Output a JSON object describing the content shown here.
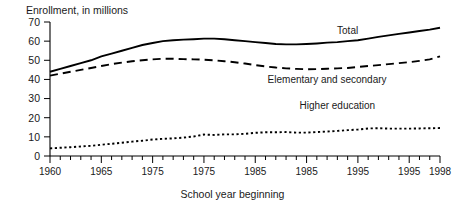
{
  "chart_data": {
    "type": "line",
    "title": "Enrollment, in millions",
    "xlabel": "School year beginning",
    "ylabel": "",
    "xlim": [
      1960,
      1998
    ],
    "ylim": [
      0,
      70
    ],
    "grid": false,
    "legend_position": "inline-annotations",
    "y_ticks": [
      70,
      60,
      50,
      40,
      30,
      20,
      10,
      0
    ],
    "x_ticks": [
      1960,
      1965,
      1975,
      1975,
      1985,
      1985,
      1995,
      1995,
      1998
    ],
    "x_tick_positions": [
      1960,
      1965,
      1970,
      1975,
      1980,
      1985,
      1990,
      1995,
      1998
    ],
    "x_minor_step": 1,
    "x": [
      1960,
      1961,
      1962,
      1963,
      1964,
      1965,
      1966,
      1967,
      1968,
      1969,
      1970,
      1971,
      1972,
      1973,
      1974,
      1975,
      1976,
      1977,
      1978,
      1979,
      1980,
      1981,
      1982,
      1983,
      1984,
      1985,
      1986,
      1987,
      1988,
      1989,
      1990,
      1991,
      1992,
      1993,
      1994,
      1995,
      1996,
      1997,
      1998
    ],
    "series": [
      {
        "name": "Total",
        "style": "solid",
        "annotation": "Total",
        "values": [
          44.0,
          45.5,
          47.0,
          48.5,
          50.0,
          52.0,
          53.5,
          55.0,
          56.5,
          58.0,
          59.0,
          60.0,
          60.5,
          60.8,
          61.0,
          61.3,
          61.3,
          61.0,
          60.5,
          60.0,
          59.5,
          59.0,
          58.5,
          58.3,
          58.3,
          58.5,
          58.8,
          59.2,
          59.5,
          60.0,
          60.5,
          61.3,
          62.2,
          63.0,
          63.8,
          64.5,
          65.3,
          66.0,
          67.0
        ]
      },
      {
        "name": "Elementary and secondary",
        "style": "dashed",
        "annotation": "Elementary and secondary",
        "values": [
          42.0,
          43.0,
          44.0,
          45.0,
          46.0,
          47.0,
          48.0,
          48.8,
          49.5,
          50.0,
          50.5,
          50.8,
          50.8,
          50.6,
          50.5,
          50.3,
          50.0,
          49.5,
          49.0,
          48.3,
          47.5,
          46.8,
          46.2,
          45.8,
          45.5,
          45.3,
          45.4,
          45.6,
          45.8,
          46.0,
          46.5,
          47.0,
          47.5,
          48.0,
          48.5,
          49.0,
          49.7,
          50.5,
          52.0
        ]
      },
      {
        "name": "Higher education",
        "style": "dotted",
        "annotation": "Higher education",
        "values": [
          4.0,
          4.3,
          4.6,
          5.0,
          5.3,
          5.9,
          6.4,
          6.9,
          7.5,
          8.0,
          8.6,
          9.0,
          9.2,
          9.6,
          10.2,
          11.2,
          11.0,
          11.3,
          11.3,
          11.6,
          12.1,
          12.4,
          12.4,
          12.5,
          12.2,
          12.2,
          12.5,
          12.8,
          13.1,
          13.5,
          13.8,
          14.4,
          14.5,
          14.3,
          14.3,
          14.3,
          14.4,
          14.5,
          14.6
        ]
      }
    ]
  }
}
